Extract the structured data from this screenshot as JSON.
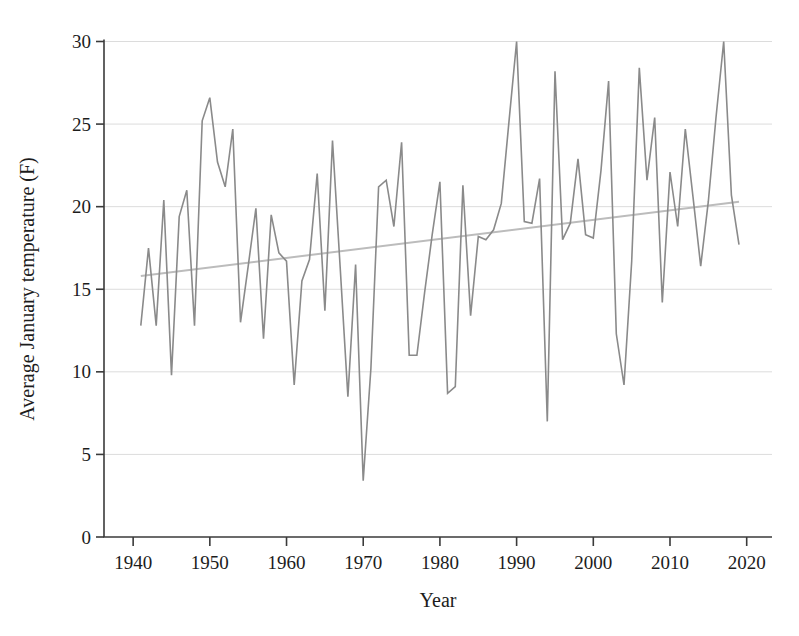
{
  "chart_data": {
    "type": "line",
    "title": "",
    "xlabel": "Year",
    "ylabel": "Average January temperature (F)",
    "x": [
      1941,
      1942,
      1943,
      1944,
      1945,
      1946,
      1947,
      1948,
      1949,
      1950,
      1951,
      1952,
      1953,
      1954,
      1955,
      1956,
      1957,
      1958,
      1959,
      1960,
      1961,
      1962,
      1963,
      1964,
      1965,
      1966,
      1967,
      1968,
      1969,
      1970,
      1971,
      1972,
      1973,
      1974,
      1975,
      1976,
      1977,
      1978,
      1979,
      1980,
      1981,
      1982,
      1983,
      1984,
      1985,
      1986,
      1987,
      1988,
      1989,
      1990,
      1991,
      1992,
      1993,
      1994,
      1995,
      1996,
      1997,
      1998,
      1999,
      2000,
      2001,
      2002,
      2003,
      2004,
      2005,
      2006,
      2007,
      2008,
      2009,
      2010,
      2011,
      2012,
      2013,
      2014,
      2015,
      2016,
      2017,
      2018,
      2019
    ],
    "series": [
      {
        "name": "Average January temperature",
        "values": [
          12.8,
          17.5,
          12.8,
          20.4,
          9.8,
          19.4,
          21.0,
          12.8,
          25.2,
          26.6,
          22.7,
          21.2,
          24.7,
          13.0,
          16.4,
          19.9,
          12.0,
          19.5,
          17.2,
          16.7,
          9.2,
          15.5,
          16.8,
          22.0,
          13.7,
          24.0,
          16.3,
          8.5,
          16.5,
          3.4,
          10.2,
          21.2,
          21.6,
          18.8,
          23.9,
          11.0,
          11.0,
          14.8,
          18.3,
          21.5,
          8.7,
          9.1,
          21.3,
          13.4,
          18.2,
          18.0,
          18.6,
          20.2,
          25.1,
          30.0,
          19.1,
          19.0,
          21.7,
          7.0,
          28.2,
          18.0,
          19.0,
          22.9,
          18.3,
          18.1,
          22.2,
          27.6,
          12.3,
          9.2,
          16.7,
          28.4,
          21.6,
          25.4,
          14.2,
          22.1,
          18.8,
          24.7,
          20.6,
          16.4,
          20.3,
          25.4,
          30.0,
          20.7,
          17.7
        ]
      }
    ],
    "trend_line": {
      "x": [
        1941,
        2019
      ],
      "values": [
        15.8,
        20.3
      ]
    },
    "x_ticks": [
      1940,
      1950,
      1960,
      1970,
      1980,
      1990,
      2000,
      2010,
      2020
    ],
    "y_ticks": [
      0,
      5,
      10,
      15,
      20,
      25,
      30
    ],
    "xlim": [
      1936.2,
      2023.3
    ],
    "ylim": [
      0,
      30
    ],
    "grid": "horizontal-only",
    "legend": "none",
    "colors": {
      "series_line": "#8a8a8a",
      "trend_line": "#bcbcbc",
      "gridline": "#dcdcdc",
      "axis": "#3a3a3a",
      "text": "#1c1c1c"
    }
  }
}
